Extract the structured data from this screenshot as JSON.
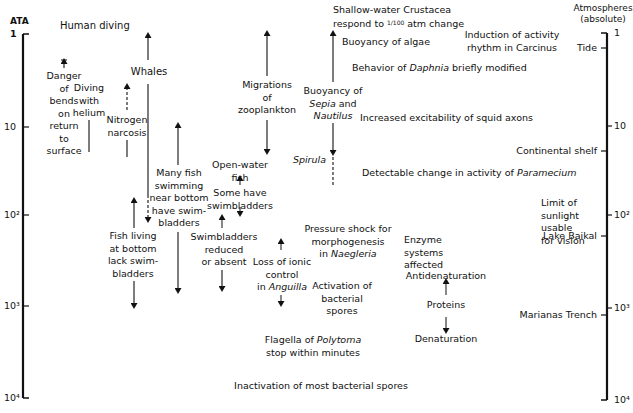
{
  "axes": {
    "left": {
      "title": "ATA",
      "ticks": [
        "1",
        "10",
        "10²",
        "10³",
        "10⁴"
      ]
    },
    "right": {
      "title_line1": "Atmospheres",
      "title_line2": "(absolute)",
      "ticks": [
        "1",
        "10",
        "10²",
        "10³",
        "10⁴"
      ]
    }
  },
  "scale": {
    "type": "log",
    "range": [
      1,
      10000
    ],
    "unit": "atmospheres absolute"
  },
  "depth_markers": [
    {
      "label": "Tide",
      "ata": 1.4
    },
    {
      "label": "Continental shelf",
      "ata": 20
    },
    {
      "label": "Limit of sunlight\nusable for vision",
      "ata": 100
    },
    {
      "label": "Lake Baikal",
      "ata": 170
    },
    {
      "label": "Marianas Trench",
      "ata": 1200
    }
  ],
  "human_diving": {
    "title": "Human diving",
    "bends": "Danger\nof\nbends\non\nreturn\nto\nsurface",
    "helium": "Diving\nwith\nhelium",
    "narcosis": "Nitrogen\nnarcosis"
  },
  "animals": {
    "whales": "Whales",
    "many_fish": "Many fish\nswimming\nnear bottom\nhave swim-\nbladders",
    "fish_bottom": "Fish living\nat bottom\nlack swim-\nbladders",
    "zooplankton": "Migrations\nof\nzooplankton",
    "open_water": "Open-water\nfish",
    "some_have": "Some have\nswimbladders",
    "swimbladders_reduced": "Swimbladders\nreduced\nor absent",
    "ionic_1": "Loss of ionic",
    "ionic_2": "control",
    "ionic_3_pre": "in ",
    "ionic_3_it": "Anguilla",
    "sepia_1": "Buoyancy of",
    "sepia_2_it": "Sepia",
    "sepia_2": " and",
    "sepia_3_it": "Nautilus",
    "spirula": "Spirula"
  },
  "effects": {
    "crustacea_1": "Shallow-water Crustacea",
    "crustacea_2_pre": "respond to ",
    "crustacea_fraction": "1/100",
    "crustacea_2_post": " atm change",
    "algae": "Buoyancy of algae",
    "carcinus": "Induction of activity\nrhythm in Carcinus",
    "daphnia_pre": "Behavior of ",
    "daphnia_it": "Daphnia",
    "daphnia_post": " briefly modified",
    "squid": "Increased excitability of squid axons",
    "paramecium_pre": "Detectable change in activity of ",
    "paramecium_it": "Paramecium",
    "naegleria_1": "Pressure shock for",
    "naegleria_2": "morphogenesis",
    "naegleria_3_pre": "in ",
    "naegleria_3_it": "Naegleria",
    "enzyme": "Enzyme\nsystems\naffected",
    "antidenaturation": "Antidenaturation",
    "proteins": "Proteins",
    "denaturation": "Denaturation",
    "bacterial_activation": "Activation of\nbacterial\nspores",
    "polytoma_pre": "Flagella of ",
    "polytoma_it": "Polytoma",
    "polytoma_2": "stop within minutes",
    "bacterial_inactivation": "Inactivation of most bacterial spores"
  }
}
